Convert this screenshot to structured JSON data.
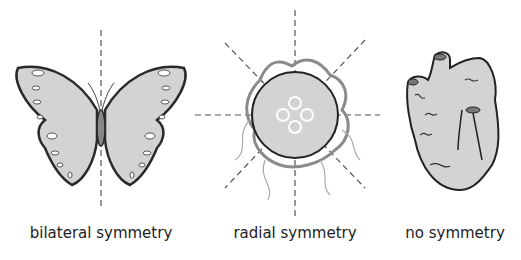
{
  "figure": {
    "panels": [
      {
        "id": "bilateral",
        "subject": "butterfly",
        "label": "bilateral symmetry",
        "symmetry_axes": 1
      },
      {
        "id": "radial",
        "subject": "jellyfish",
        "label": "radial symmetry",
        "symmetry_axes": 4
      },
      {
        "id": "none",
        "subject": "sponge",
        "label": "no symmetry",
        "symmetry_axes": 0
      }
    ],
    "colors": {
      "fill": "#d3d3d3",
      "outline": "#2a2a2a",
      "axis": "#555555",
      "tentacle": "#8a8a8a"
    }
  }
}
